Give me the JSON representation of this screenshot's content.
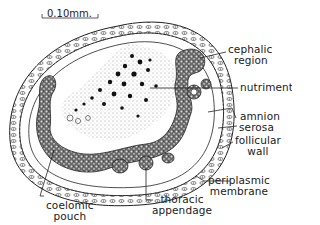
{
  "figure": {
    "type": "biological cross-section diagram",
    "scale_bar": {
      "label": "0.10mm."
    },
    "labels": {
      "cephalic_region": [
        "cephalic",
        "region"
      ],
      "nutriment": "nutriment",
      "amnion": "amnion",
      "serosa": "serosa",
      "follicular_wall": [
        "follicular",
        "wall"
      ],
      "periplasmic_membrane": [
        "periplasmic",
        "membrane"
      ],
      "coelomic_pouch": [
        "coelomic",
        "pouch"
      ],
      "thoracic_appendage": [
        "thoracic",
        "appendage"
      ]
    },
    "colors": {
      "ink": "#1a1a1a",
      "background": "#ffffff"
    }
  }
}
